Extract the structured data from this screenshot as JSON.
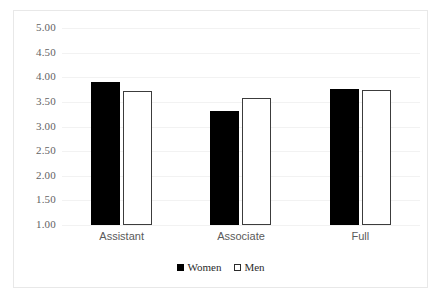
{
  "chart_data": {
    "type": "bar",
    "title": "",
    "subtitle": "",
    "xlabel": "",
    "ylabel": "",
    "categories": [
      "Assistant",
      "Associate",
      "Full"
    ],
    "series": [
      {
        "name": "Women",
        "values": [
          3.9,
          3.32,
          3.77
        ],
        "color": "#000000",
        "style": "filled"
      },
      {
        "name": "Men",
        "values": [
          3.72,
          3.57,
          3.75
        ],
        "color": "#ffffff",
        "style": "outlined"
      }
    ],
    "ylim": [
      1.0,
      5.0
    ],
    "ytick_labels": [
      "5.00",
      "4.50",
      "4.00",
      "3.50",
      "3.00",
      "2.50",
      "2.00",
      "1.50",
      "1.00"
    ],
    "ytick_values": [
      5.0,
      4.5,
      4.0,
      3.5,
      3.0,
      2.5,
      2.0,
      1.5,
      1.0
    ],
    "grid": true,
    "grid_color": "#f2f2f2",
    "legend_position": "bottom",
    "legend": [
      "Women",
      "Men"
    ],
    "frame_color": "#e8e8e8",
    "background": "#ffffff"
  }
}
